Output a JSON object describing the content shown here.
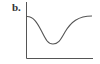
{
  "panel_label": "b.",
  "diagram": {
    "curve_shape": "trough",
    "axes": [
      "y-axis",
      "x-axis"
    ],
    "line_color": "#555555"
  }
}
